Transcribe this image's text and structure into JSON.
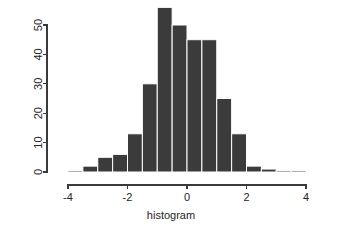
{
  "chart_data": {
    "type": "bar",
    "title": "",
    "subtitle": "",
    "xlabel": "histogram",
    "ylabel": "",
    "grid": false,
    "legend": "none",
    "xlim": [
      -4.2,
      4.2
    ],
    "ylim": [
      0,
      56
    ],
    "bin_width": 0.5,
    "bar_color": "#3b3b3b",
    "bar_border_color": "#ffffff",
    "axis_color": "#3a3a3a",
    "x_ticks": [
      -4,
      -2,
      0,
      2,
      4
    ],
    "x_tick_labels": [
      "-4",
      "-2",
      "0",
      "2",
      "4"
    ],
    "y_ticks": [
      0,
      10,
      20,
      30,
      40,
      50
    ],
    "y_tick_labels": [
      "0",
      "10",
      "20",
      "30",
      "40",
      "50"
    ],
    "bin_starts": [
      -4.0,
      -3.5,
      -3.0,
      -2.5,
      -2.0,
      -1.5,
      -1.0,
      -0.5,
      0.0,
      0.5,
      1.0,
      1.5,
      2.0,
      2.5,
      3.0,
      3.5
    ],
    "bin_centers": [
      -3.75,
      -3.25,
      -2.75,
      -2.25,
      -1.75,
      -1.25,
      -0.75,
      -0.25,
      0.25,
      0.75,
      1.25,
      1.75,
      2.25,
      2.75,
      3.25,
      3.75
    ],
    "categories": [
      "-4.0",
      "-3.5",
      "-3.0",
      "-2.5",
      "-2.0",
      "-1.5",
      "-1.0",
      "-0.5",
      "0.0",
      "0.5",
      "1.0",
      "1.5",
      "2.0",
      "2.5",
      "3.0",
      "3.5"
    ],
    "values": [
      0,
      2,
      5,
      6,
      13,
      30,
      56,
      50,
      45,
      45,
      25,
      13,
      2,
      1,
      0,
      0
    ]
  },
  "axis": {
    "x_label": "histogram",
    "y_label": ""
  },
  "labels": {
    "x_tick_minus4": "-4",
    "x_tick_minus2": "-2",
    "x_tick_zero": "0",
    "x_tick_two": "2",
    "x_tick_four": "4",
    "y_tick_0": "0",
    "y_tick_10": "10",
    "y_tick_20": "20",
    "y_tick_30": "30",
    "y_tick_40": "40",
    "y_tick_50": "50"
  }
}
